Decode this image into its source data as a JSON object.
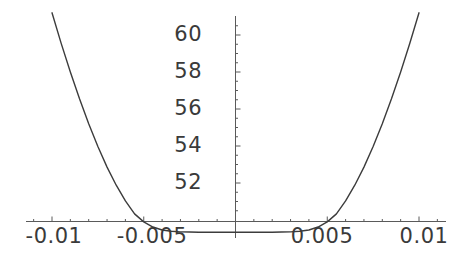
{
  "chart_data": {
    "type": "line",
    "title": "",
    "subtitle": "",
    "xlabel": "",
    "ylabel": "",
    "grid": false,
    "legend": false,
    "legend_position": "none",
    "xlim": [
      -0.0115,
      0.0115
    ],
    "ylim": [
      49.2,
      61.4
    ],
    "x_ticks": [
      -0.01,
      -0.005,
      0.005,
      0.01
    ],
    "x_tick_labels": [
      "-0.01",
      "-0.005",
      "0.005",
      "0.01"
    ],
    "x_minor_tick_count_between": 4,
    "y_ticks": [
      52,
      54,
      56,
      58,
      60
    ],
    "y_tick_labels": [
      "52",
      "54",
      "56",
      "58",
      "60"
    ],
    "y_minor_tick_count_between": 3,
    "axis_origin": {
      "x": 0,
      "y": 50
    },
    "series": [
      {
        "name": "curve",
        "color": "#3c3c3c",
        "x": [
          -0.01,
          -0.0095,
          -0.009,
          -0.0085,
          -0.008,
          -0.0075,
          -0.007,
          -0.0065,
          -0.006,
          -0.0055,
          -0.005,
          -0.0045,
          -0.004,
          -0.0035,
          -0.003,
          -0.0025,
          -0.002,
          -0.0015,
          -0.001,
          -0.0005,
          0.0,
          0.0005,
          0.001,
          0.0015,
          0.002,
          0.0025,
          0.003,
          0.0035,
          0.004,
          0.0045,
          0.005,
          0.0055,
          0.006,
          0.0065,
          0.007,
          0.0075,
          0.008,
          0.0085,
          0.009,
          0.0095,
          0.01
        ],
        "y": [
          61.2,
          59.55,
          58.0,
          56.55,
          55.2,
          53.97,
          52.86,
          51.88,
          51.03,
          50.33,
          49.9,
          49.62,
          49.46,
          49.39,
          49.36,
          49.35,
          49.34,
          49.34,
          49.34,
          49.34,
          49.34,
          49.34,
          49.34,
          49.34,
          49.34,
          49.35,
          49.36,
          49.39,
          49.46,
          49.62,
          49.9,
          50.33,
          51.03,
          51.88,
          52.86,
          53.97,
          55.2,
          56.55,
          58.0,
          59.55,
          61.2
        ]
      }
    ]
  },
  "axes": {
    "x_axis_name": "horizontal-axis",
    "y_axis_name": "vertical-axis",
    "axis_color": "#5a5a5a"
  }
}
